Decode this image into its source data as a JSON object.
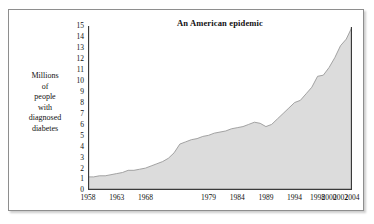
{
  "figure": {
    "background_color": "#ffffff",
    "border_color": "#8e8e8e"
  },
  "chart_data": {
    "type": "area",
    "title": "An American epidemic",
    "xlabel": "",
    "ylabel": "Millions of people with diagnosed diabetes",
    "ylabel_lines": [
      "Millions",
      "of",
      "people",
      "with",
      "diagnosed",
      "diabetes"
    ],
    "xlim": [
      1958,
      2004
    ],
    "ylim": [
      0,
      15
    ],
    "grid": false,
    "legend": "none",
    "fill_color": "#dcdcdc",
    "line_color": "#9a9a9a",
    "axis_color": "#3a3a3a",
    "y_ticks": [
      0,
      1,
      2,
      3,
      4,
      5,
      6,
      7,
      8,
      9,
      10,
      11,
      12,
      13,
      14,
      15
    ],
    "x_ticks": [
      1958,
      1963,
      1968,
      1979,
      1984,
      1989,
      1994,
      1998,
      2000,
      2002,
      2004
    ],
    "x_tick_labels": [
      "1958",
      "1963",
      "1968",
      "1979",
      "1984",
      "1989",
      "1994",
      "1998",
      "2000",
      "2002",
      "2004"
    ],
    "series": [
      {
        "name": "Millions of people with diagnosed diabetes",
        "x": [
          1958,
          1959,
          1960,
          1961,
          1962,
          1963,
          1964,
          1965,
          1966,
          1967,
          1968,
          1969,
          1970,
          1971,
          1972,
          1973,
          1974,
          1975,
          1976,
          1977,
          1978,
          1979,
          1980,
          1981,
          1982,
          1983,
          1984,
          1985,
          1986,
          1987,
          1988,
          1989,
          1990,
          1991,
          1992,
          1993,
          1994,
          1995,
          1996,
          1997,
          1998,
          1999,
          2000,
          2001,
          2002,
          2003,
          2004
        ],
        "values": [
          1.2,
          1.2,
          1.3,
          1.3,
          1.4,
          1.5,
          1.6,
          1.8,
          1.8,
          1.9,
          2.0,
          2.2,
          2.4,
          2.6,
          2.9,
          3.4,
          4.2,
          4.4,
          4.6,
          4.7,
          4.9,
          5.0,
          5.2,
          5.3,
          5.4,
          5.6,
          5.7,
          5.8,
          6.0,
          6.2,
          6.1,
          5.8,
          6.0,
          6.5,
          7.0,
          7.5,
          8.0,
          8.2,
          8.8,
          9.4,
          10.4,
          10.5,
          11.2,
          12.1,
          13.2,
          13.8,
          14.9
        ]
      }
    ]
  }
}
